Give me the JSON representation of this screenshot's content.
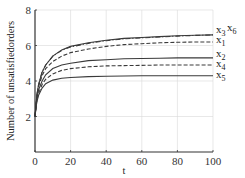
{
  "chart_data": {
    "type": "line",
    "title": "",
    "xlabel": "t",
    "ylabel": "Number of unsatisfiedorders",
    "xlim": [
      0,
      100
    ],
    "ylim": [
      0,
      8
    ],
    "xticks": [
      0,
      20,
      40,
      60,
      80,
      100
    ],
    "yticks": [
      2,
      4,
      6,
      8
    ],
    "grid": true,
    "legend_position": "right-inline",
    "x": [
      0,
      1,
      2,
      4,
      6,
      10,
      15,
      20,
      30,
      40,
      50,
      60,
      70,
      80,
      90,
      100
    ],
    "series": [
      {
        "name": "x3",
        "label": "x3",
        "style": "solid",
        "values": [
          2.0,
          3.2,
          3.8,
          4.5,
          4.9,
          5.4,
          5.75,
          5.95,
          6.15,
          6.3,
          6.4,
          6.45,
          6.5,
          6.55,
          6.58,
          6.6
        ]
      },
      {
        "name": "x6",
        "label": "x6",
        "style": "dashdot",
        "values": [
          2.0,
          3.2,
          3.8,
          4.5,
          4.9,
          5.4,
          5.72,
          5.92,
          6.12,
          6.27,
          6.37,
          6.43,
          6.48,
          6.53,
          6.57,
          6.6
        ]
      },
      {
        "name": "x1",
        "label": "x1",
        "style": "dashed",
        "values": [
          2.0,
          3.1,
          3.7,
          4.3,
          4.7,
          5.1,
          5.4,
          5.6,
          5.8,
          5.95,
          6.05,
          6.1,
          6.15,
          6.18,
          6.2,
          6.2
        ]
      },
      {
        "name": "x2",
        "label": "x2",
        "style": "solid",
        "values": [
          2.0,
          3.0,
          3.5,
          4.0,
          4.35,
          4.7,
          4.9,
          5.0,
          5.15,
          5.2,
          5.25,
          5.27,
          5.28,
          5.3,
          5.3,
          5.3
        ]
      },
      {
        "name": "x4",
        "label": "x4",
        "style": "dashed",
        "values": [
          2.0,
          2.9,
          3.3,
          3.8,
          4.1,
          4.4,
          4.6,
          4.7,
          4.8,
          4.85,
          4.87,
          4.88,
          4.9,
          4.9,
          4.9,
          4.9
        ]
      },
      {
        "name": "x5",
        "label": "x5",
        "style": "solid",
        "values": [
          2.0,
          2.8,
          3.2,
          3.6,
          3.85,
          4.05,
          4.15,
          4.2,
          4.25,
          4.27,
          4.28,
          4.3,
          4.3,
          4.3,
          4.3,
          4.3
        ]
      }
    ]
  },
  "labels": {
    "xlabel": "t",
    "ylabel": "Number of unsatisfiedorders",
    "xticks": [
      "0",
      "20",
      "40",
      "60",
      "80",
      "100"
    ],
    "yticks": [
      "2",
      "4",
      "6",
      "8"
    ],
    "legend": {
      "x3": {
        "base": "x",
        "sub": "3"
      },
      "x6": {
        "base": "x",
        "sub": "6"
      },
      "x1": {
        "base": "x",
        "sub": "1"
      },
      "x2": {
        "base": "x",
        "sub": "2"
      },
      "x4": {
        "base": "x",
        "sub": "4"
      },
      "x5": {
        "base": "x",
        "sub": "5"
      }
    }
  },
  "colors": {
    "line": "#3a3a3a",
    "axis": "#333333",
    "grid": "#d8d8d8"
  }
}
